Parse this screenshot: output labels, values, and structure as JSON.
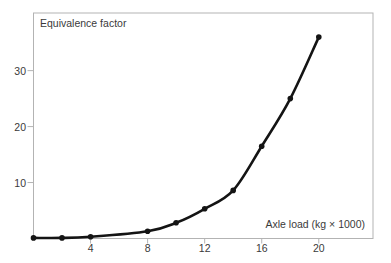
{
  "figure": {
    "background": "#ffffff",
    "frame_color": "#b3b3b3",
    "curve_color": "#141414",
    "marker_color": "#141414",
    "text_color": "#3a3a3a"
  },
  "chart_data": {
    "type": "line",
    "title": "Equivalence factor",
    "xlabel": "Axle load (kg × 1000)",
    "ylabel": "Equivalence factor",
    "x": [
      0,
      2,
      4,
      8,
      10,
      12,
      14,
      16,
      18,
      20
    ],
    "y": [
      0.1,
      0.1,
      0.3,
      1.3,
      2.8,
      5.3,
      8.6,
      16.5,
      25,
      36
    ],
    "xticks": [
      4,
      8,
      12,
      16,
      20
    ],
    "yticks": [
      10,
      20,
      30
    ],
    "xlim": [
      0,
      23.8
    ],
    "ylim": [
      0,
      40.3
    ],
    "grid": false,
    "legend_position": "none",
    "marker": "circle",
    "note": "Fourth-power load equivalency curve: equivalence factor rises steeply with axle load"
  }
}
